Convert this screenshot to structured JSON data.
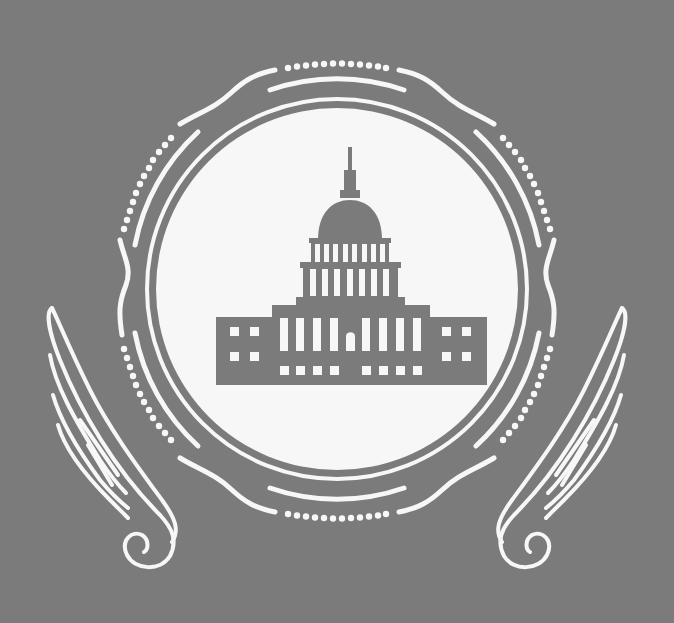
{
  "emblem": {
    "subject": "capitol-building",
    "colors": {
      "background": "#7b7b7b",
      "foreground": "#f7f7f7",
      "building": "#7b7b7b"
    },
    "elements": [
      "capitol-building-icon",
      "seal-ring",
      "dotted-arcs",
      "wavy-border",
      "left-wing",
      "right-wing"
    ]
  }
}
